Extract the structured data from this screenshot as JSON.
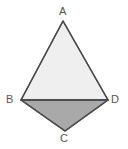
{
  "figure": {
    "kind": "geometry-figure",
    "background_color": "#ffffff",
    "stroke_color": "#4a4a4a",
    "stroke_width": 1.4,
    "label_color": "#565656",
    "upper_triangle": {
      "name": "triangle-ABD",
      "fill_color": "#efefef",
      "vertices": [
        "A",
        "B",
        "D"
      ],
      "points": "63,21 21,100 108,100"
    },
    "lower_triangle": {
      "name": "triangle-BCD",
      "fill_color": "#a9a9a9",
      "vertices": [
        "B",
        "C",
        "D"
      ],
      "points": "21,100 65,131 108,100"
    },
    "diagonal": {
      "name": "diagonal-BD",
      "from": "B",
      "to": "D",
      "x1": 21,
      "y1": 100,
      "x2": 108,
      "y2": 100
    },
    "vertices": [
      {
        "id": "A",
        "label": "A",
        "x": 63,
        "y": 21
      },
      {
        "id": "B",
        "label": "B",
        "x": 21,
        "y": 100
      },
      {
        "id": "C",
        "label": "C",
        "x": 65,
        "y": 131
      },
      {
        "id": "D",
        "label": "D",
        "x": 108,
        "y": 100
      }
    ],
    "outline_points": "63,21 108,100 65,131 21,100"
  }
}
